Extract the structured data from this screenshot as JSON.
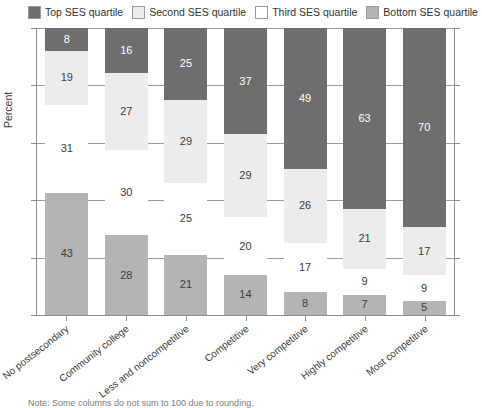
{
  "legend": {
    "position": "top",
    "items": [
      {
        "label": "Top SES quartile",
        "color": "#6e6e6e"
      },
      {
        "label": "Second SES quartile",
        "color": "#ececec"
      },
      {
        "label": "Third SES quartile",
        "color": "#ffffff"
      },
      {
        "label": "Bottom SES quartile",
        "color": "#b4b4b4"
      }
    ]
  },
  "axes": {
    "ylabel": "Percent",
    "xlabel": "",
    "ylim": [
      0,
      100
    ],
    "yticks": [
      0,
      20,
      40,
      60,
      80,
      100
    ],
    "grid": true
  },
  "note": {
    "text": "Note: Some columns do not sum to 100 due to rounding."
  },
  "chart_data": {
    "type": "bar",
    "title": "",
    "xlabel": "",
    "ylabel": "Percent",
    "ylim": [
      0,
      100
    ],
    "grid": true,
    "stacked": true,
    "legend_position": "top",
    "categories": [
      "No postsecondary",
      "Community college",
      "Less and noncompetitive",
      "Competitive",
      "Very competitive",
      "Highly competitive",
      "Most competitive"
    ],
    "series": [
      {
        "name": "Top SES quartile",
        "color": "#6e6e6e",
        "label_color": "#ffffff",
        "values": [
          8,
          16,
          25,
          37,
          49,
          63,
          70
        ]
      },
      {
        "name": "Second SES quartile",
        "color": "#ececec",
        "label_color": "#3b3b3b",
        "values": [
          19,
          27,
          29,
          29,
          26,
          21,
          17
        ]
      },
      {
        "name": "Third SES quartile",
        "color": "#ffffff",
        "label_color": "#3b3b3b",
        "values": [
          31,
          30,
          25,
          20,
          17,
          9,
          9
        ]
      },
      {
        "name": "Bottom SES quartile",
        "color": "#b4b4b4",
        "label_color": "#3b3b3b",
        "values": [
          43,
          28,
          21,
          14,
          8,
          7,
          5
        ]
      }
    ]
  }
}
